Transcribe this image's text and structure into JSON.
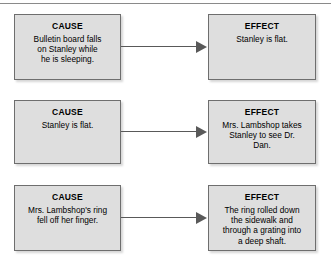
{
  "diagram": {
    "type": "cause-and-effect",
    "divider": "horizontal-rule",
    "cause_label": "CAUSE",
    "effect_label": "EFFECT",
    "arrow_icon": "arrow-right-icon",
    "colors": {
      "box_fill": "#dedede",
      "box_border": "#6e6e6e",
      "arrow": "#595959",
      "rule": "#8a8a8a",
      "text": "#000000",
      "background": "#ffffff"
    },
    "rows": [
      {
        "cause": {
          "title": "CAUSE",
          "text": "Bulletin board falls\non Stanley while\nhe is sleeping."
        },
        "effect": {
          "title": "EFFECT",
          "text": "Stanley is flat."
        }
      },
      {
        "cause": {
          "title": "CAUSE",
          "text": "Stanley is flat."
        },
        "effect": {
          "title": "EFFECT",
          "text": "Mrs. Lambshop takes\nStanley to see Dr.\nDan."
        }
      },
      {
        "cause": {
          "title": "CAUSE",
          "text": "Mrs. Lambshop's ring\nfell off  her finger."
        },
        "effect": {
          "title": "EFFECT",
          "text": "The ring rolled down\nthe sidewalk and\nthrough a grating into\na deep shaft."
        }
      }
    ]
  }
}
